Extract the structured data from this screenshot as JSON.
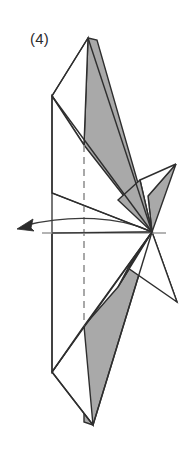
{
  "figure": {
    "kind": "origami-fold-diagram",
    "step_label": "(4)",
    "caption_text": "(4)",
    "colors": {
      "paper_front": "#ffffff",
      "paper_back_shaded": "#a9a9a9",
      "outline": "#2e2e2e",
      "fold_dashed": "#8c8c8c",
      "axis_line": "#9a9a9a",
      "arrow": "#3a3a3a",
      "background": "#ffffff",
      "label_text": "#2b2b2b"
    },
    "geometry": {
      "canvas": {
        "width": 192,
        "height": 454
      },
      "top_apex": {
        "x": 88,
        "y": 38
      },
      "left_upper_vertex": {
        "x": 52,
        "y": 96
      },
      "left_mid_vertex": {
        "x": 52,
        "y": 193
      },
      "left_lower_vertex": {
        "x": 52,
        "y": 372
      },
      "bottom_apex": {
        "x": 93,
        "y": 425
      },
      "center_hinge": {
        "x": 152,
        "y": 232
      },
      "right_upper_tip": {
        "x": 176,
        "y": 164
      },
      "right_lower_tip": {
        "x": 177,
        "y": 302
      },
      "white_tri_left_vertex": {
        "x": 140,
        "y": 180
      },
      "gray_lower_vertex": {
        "x": 118,
        "y": 287
      },
      "dashed_fold_x": 84,
      "dashed_fold_y_top": 145,
      "dashed_fold_y_bottom": 326,
      "axis_y": 233,
      "axis_x_start": 42,
      "axis_x_end": 166,
      "arrow_tip": {
        "x": 17,
        "y": 229
      }
    },
    "elements": {
      "top_gray_wing_name": "upper-shaded-flap",
      "bottom_gray_wing_name": "lower-shaded-flap",
      "right_gray_point_name": "right-shaded-point",
      "rotation_arrow_name": "rotation-arrow",
      "dashed_fold_name": "hidden-fold-dashed-line",
      "axis_name": "rotation-axis-line"
    }
  }
}
